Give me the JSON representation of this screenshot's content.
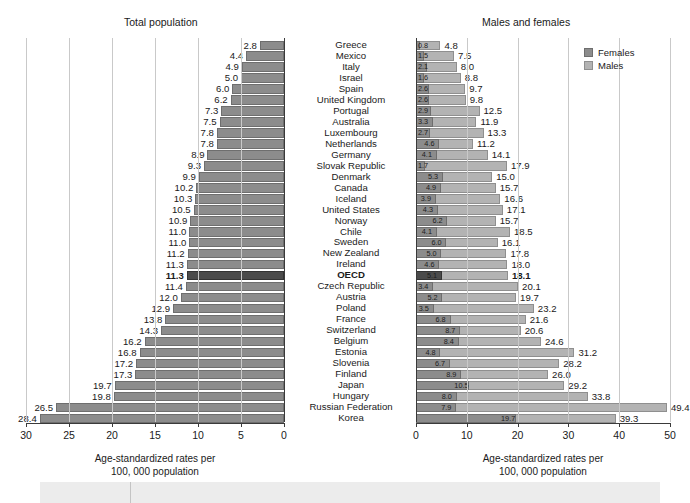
{
  "panels": {
    "left_title": "Total population",
    "right_title": "Males and females"
  },
  "legend": {
    "position": "top-right",
    "items": [
      {
        "label": "Females",
        "color": "#8c8c8c"
      },
      {
        "label": "Males",
        "color": "#b3b3b3"
      }
    ]
  },
  "axis_caption_line1": "Age-standardized rates per",
  "axis_caption_line2": "100, 000 population",
  "chart_data": {
    "type": "bar",
    "orientation": "horizontal",
    "grid": true,
    "panels": [
      {
        "name": "total_population",
        "title": "Total population",
        "xlabel": "Age-standardized rates per 100, 000 population",
        "xlim": [
          30,
          0
        ],
        "reversed": true,
        "ticks": [
          30,
          25,
          20,
          15,
          10,
          5,
          0
        ],
        "series": [
          {
            "name": "Total population",
            "color": "#8c8c8c"
          }
        ]
      },
      {
        "name": "males_and_females",
        "title": "Males and females",
        "xlabel": "Age-standardized rates per 100, 000 population",
        "xlim": [
          0,
          50
        ],
        "reversed": false,
        "ticks": [
          0,
          10,
          20,
          30,
          40,
          50
        ],
        "series": [
          {
            "name": "Females",
            "color": "#8c8c8c"
          },
          {
            "name": "Males",
            "color": "#b3b3b3"
          }
        ]
      }
    ],
    "categories": [
      "Greece",
      "Mexico",
      "Italy",
      "Israel",
      "Spain",
      "United Kingdom",
      "Portugal",
      "Australia",
      "Luxembourg",
      "Netherlands",
      "Germany",
      "Slovak Republic",
      "Denmark",
      "Canada",
      "Iceland",
      "United States",
      "Norway",
      "Chile",
      "Sweden",
      "New Zealand",
      "Ireland",
      "OECD",
      "Czech Republic",
      "Austria",
      "Poland",
      "France",
      "Switzerland",
      "Belgium",
      "Estonia",
      "Slovenia",
      "Finland",
      "Japan",
      "Hungary",
      "Russian Federation",
      "Korea"
    ],
    "highlight_category": "OECD",
    "total": [
      2.8,
      4.4,
      4.9,
      5.0,
      6.0,
      6.2,
      7.3,
      7.5,
      7.8,
      7.8,
      8.9,
      9.3,
      9.9,
      10.2,
      10.3,
      10.5,
      10.9,
      11.0,
      11.0,
      11.2,
      11.3,
      11.3,
      11.4,
      12.0,
      12.9,
      13.8,
      14.3,
      16.2,
      16.8,
      17.2,
      17.3,
      19.7,
      19.8,
      26.5,
      28.4
    ],
    "females": [
      0.8,
      1.5,
      2.1,
      1.6,
      2.6,
      2.6,
      2.9,
      3.3,
      2.7,
      4.6,
      4.1,
      1.7,
      5.3,
      4.9,
      3.9,
      4.3,
      6.2,
      4.1,
      6.0,
      5.0,
      4.6,
      5.1,
      3.4,
      5.2,
      3.5,
      6.8,
      8.7,
      8.4,
      4.8,
      6.7,
      8.9,
      10.5,
      8.0,
      7.9,
      19.7
    ],
    "males": [
      4.8,
      7.5,
      8.0,
      8.8,
      9.7,
      9.8,
      12.5,
      11.9,
      13.3,
      11.2,
      14.1,
      17.9,
      15.0,
      15.7,
      16.6,
      17.1,
      15.7,
      18.5,
      16.1,
      17.8,
      18.0,
      18.1,
      20.1,
      19.7,
      23.2,
      21.6,
      20.6,
      24.6,
      31.2,
      28.2,
      26.0,
      29.2,
      33.8,
      49.4,
      39.3
    ],
    "rows": [
      {
        "country": "Greece",
        "total": 2.8,
        "females": 0.8,
        "males": 4.8
      },
      {
        "country": "Mexico",
        "total": 4.4,
        "females": 1.5,
        "males": 7.5
      },
      {
        "country": "Italy",
        "total": 4.9,
        "females": 2.1,
        "males": 8.0
      },
      {
        "country": "Israel",
        "total": 5.0,
        "females": 1.6,
        "males": 8.8
      },
      {
        "country": "Spain",
        "total": 6.0,
        "females": 2.6,
        "males": 9.7
      },
      {
        "country": "United Kingdom",
        "total": 6.2,
        "females": 2.6,
        "males": 9.8
      },
      {
        "country": "Portugal",
        "total": 7.3,
        "females": 2.9,
        "males": 12.5
      },
      {
        "country": "Australia",
        "total": 7.5,
        "females": 3.3,
        "males": 11.9
      },
      {
        "country": "Luxembourg",
        "total": 7.8,
        "females": 2.7,
        "males": 13.3
      },
      {
        "country": "Netherlands",
        "total": 7.8,
        "females": 4.6,
        "males": 11.2
      },
      {
        "country": "Germany",
        "total": 8.9,
        "females": 4.1,
        "males": 14.1
      },
      {
        "country": "Slovak Republic",
        "total": 9.3,
        "females": 1.7,
        "males": 17.9
      },
      {
        "country": "Denmark",
        "total": 9.9,
        "females": 5.3,
        "males": 15.0
      },
      {
        "country": "Canada",
        "total": 10.2,
        "females": 4.9,
        "males": 15.7
      },
      {
        "country": "Iceland",
        "total": 10.3,
        "females": 3.9,
        "males": 16.6
      },
      {
        "country": "United States",
        "total": 10.5,
        "females": 4.3,
        "males": 17.1
      },
      {
        "country": "Norway",
        "total": 10.9,
        "females": 6.2,
        "males": 15.7
      },
      {
        "country": "Chile",
        "total": 11.0,
        "females": 4.1,
        "males": 18.5
      },
      {
        "country": "Sweden",
        "total": 11.0,
        "females": 6.0,
        "males": 16.1
      },
      {
        "country": "New Zealand",
        "total": 11.2,
        "females": 5.0,
        "males": 17.8
      },
      {
        "country": "Ireland",
        "total": 11.3,
        "females": 4.6,
        "males": 18.0
      },
      {
        "country": "OECD",
        "total": 11.3,
        "females": 5.1,
        "males": 18.1
      },
      {
        "country": "Czech Republic",
        "total": 11.4,
        "females": 3.4,
        "males": 20.1
      },
      {
        "country": "Austria",
        "total": 12.0,
        "females": 5.2,
        "males": 19.7
      },
      {
        "country": "Poland",
        "total": 12.9,
        "females": 3.5,
        "males": 23.2
      },
      {
        "country": "France",
        "total": 13.8,
        "females": 6.8,
        "males": 21.6
      },
      {
        "country": "Switzerland",
        "total": 14.3,
        "females": 8.7,
        "males": 20.6
      },
      {
        "country": "Belgium",
        "total": 16.2,
        "females": 8.4,
        "males": 24.6
      },
      {
        "country": "Estonia",
        "total": 16.8,
        "females": 4.8,
        "males": 31.2
      },
      {
        "country": "Slovenia",
        "total": 17.2,
        "females": 6.7,
        "males": 28.2
      },
      {
        "country": "Finland",
        "total": 17.3,
        "females": 8.9,
        "males": 26.0
      },
      {
        "country": "Japan",
        "total": 19.7,
        "females": 10.5,
        "males": 29.2
      },
      {
        "country": "Hungary",
        "total": 19.8,
        "females": 8.0,
        "males": 33.8
      },
      {
        "country": "Russian Federation",
        "total": 26.5,
        "females": 7.9,
        "males": 49.4
      },
      {
        "country": "Korea",
        "total": 28.4,
        "females": 19.7,
        "males": 39.3
      }
    ]
  }
}
